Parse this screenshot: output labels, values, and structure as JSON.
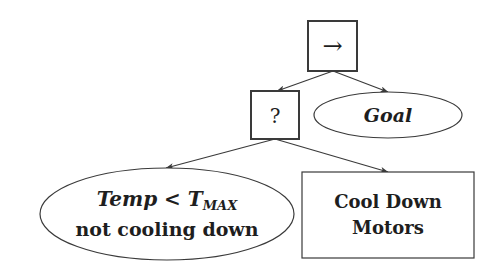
{
  "diagram": {
    "type": "behavior-tree",
    "nodes": {
      "sequence": {
        "kind": "sequence",
        "shape": "square",
        "symbol": "→",
        "x": 308,
        "y": 21,
        "w": 49,
        "h": 50
      },
      "fallback": {
        "kind": "fallback",
        "shape": "square",
        "symbol": "?",
        "x": 251,
        "y": 91,
        "w": 48,
        "h": 48
      },
      "goal": {
        "kind": "condition",
        "shape": "ellipse",
        "label": "Goal",
        "cx": 388,
        "cy": 115,
        "rx": 74,
        "ry": 23
      },
      "temp_condition": {
        "kind": "condition",
        "shape": "ellipse",
        "label_line1_var": "Temp",
        "label_line1_op": " < ",
        "label_line1_const": "T",
        "label_line1_sub": "MAX",
        "label_line2": "not cooling down",
        "cx": 167,
        "cy": 214,
        "rx": 127,
        "ry": 46
      },
      "cool_down": {
        "kind": "action",
        "shape": "rectangle",
        "label_line1": "Cool Down",
        "label_line2": "Motors",
        "x": 302,
        "y": 172,
        "w": 172,
        "h": 86
      }
    },
    "edges": [
      {
        "from": "sequence",
        "to": "fallback",
        "x1": 333,
        "y1": 71,
        "x2": 277,
        "y2": 91
      },
      {
        "from": "sequence",
        "to": "goal",
        "x1": 333,
        "y1": 71,
        "x2": 388,
        "y2": 92
      },
      {
        "from": "fallback",
        "to": "temp_condition",
        "x1": 275,
        "y1": 139,
        "x2": 166,
        "y2": 168
      },
      {
        "from": "fallback",
        "to": "cool_down",
        "x1": 275,
        "y1": 139,
        "x2": 388,
        "y2": 172
      }
    ],
    "colors": {
      "stroke": "#3a3a3a",
      "text": "#1e1e1e",
      "background": "#ffffff"
    }
  }
}
